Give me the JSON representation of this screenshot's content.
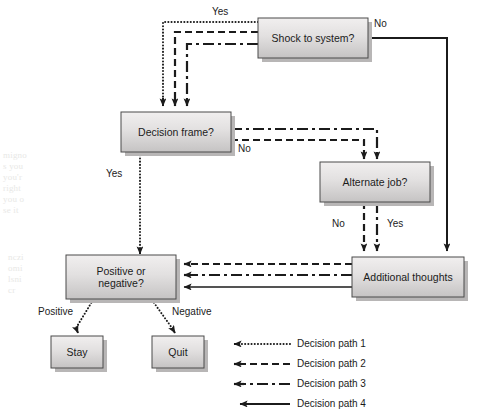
{
  "diagram": {
    "type": "flowchart",
    "nodes": [
      {
        "id": "shock",
        "label": "Shock to system?",
        "x": 258,
        "y": 18,
        "w": 110,
        "h": 40
      },
      {
        "id": "frame",
        "label": "Decision frame?",
        "x": 121,
        "y": 112,
        "w": 110,
        "h": 40
      },
      {
        "id": "alternate",
        "label": "Alternate job?",
        "x": 320,
        "y": 162,
        "w": 110,
        "h": 40
      },
      {
        "id": "additional",
        "label": "Additional thoughts",
        "x": 352,
        "y": 257,
        "w": 112,
        "h": 40
      },
      {
        "id": "posneg",
        "label": "Positive or\nnegative?",
        "x": 66,
        "y": 255,
        "w": 110,
        "h": 44
      },
      {
        "id": "stay",
        "label": "Stay",
        "x": 51,
        "y": 336,
        "w": 52,
        "h": 32
      },
      {
        "id": "quit",
        "label": "Quit",
        "x": 152,
        "y": 336,
        "w": 52,
        "h": 32
      }
    ],
    "edge_labels": [
      {
        "id": "shock-yes",
        "text": "Yes",
        "x": 212,
        "y": 6
      },
      {
        "id": "shock-no",
        "text": "No",
        "x": 374,
        "y": 18
      },
      {
        "id": "frame-no",
        "text": "No",
        "x": 238,
        "y": 143
      },
      {
        "id": "frame-yes",
        "text": "Yes",
        "x": 106,
        "y": 168
      },
      {
        "id": "alternate-no",
        "text": "No",
        "x": 332,
        "y": 218
      },
      {
        "id": "alternate-yes",
        "text": "Yes",
        "x": 387,
        "y": 218
      },
      {
        "id": "posneg-positive",
        "text": "Positive",
        "x": 38,
        "y": 306
      },
      {
        "id": "posneg-negative",
        "text": "Negative",
        "x": 172,
        "y": 306
      }
    ],
    "legend": {
      "items": [
        {
          "id": "path1",
          "label": "Decision path 1",
          "style": "dotted"
        },
        {
          "id": "path2",
          "label": "Decision path 2",
          "style": "dashed"
        },
        {
          "id": "path3",
          "label": "Decision path 3",
          "style": "dashdot"
        },
        {
          "id": "path4",
          "label": "Decision path 4",
          "style": "solid"
        }
      ],
      "x": 232,
      "y": 339,
      "row_gap": 20,
      "line_len": 58,
      "label_x": 297
    },
    "colors": {
      "line": "#1b1b1b",
      "node_fill_top": "#eceaea",
      "node_fill_bottom": "#c9c7c7",
      "node_border": "#4a4a4a",
      "node_shadow": "#b8b6b6",
      "text": "#1b1b1b",
      "background": "#ffffff",
      "ghost_text": "#e8e8e6"
    },
    "paths": [
      {
        "id": "path1",
        "name": "decision-path-1",
        "style": "dotted",
        "route": "shock Yes -> frame -> posneg -> Stay/Quit"
      },
      {
        "id": "path2",
        "name": "decision-path-2",
        "style": "dashed",
        "route": "shock Yes -> frame -> No -> alternate -> No -> additional -> posneg"
      },
      {
        "id": "path3",
        "name": "decision-path-3",
        "style": "dashdot",
        "route": "shock Yes -> frame -> No -> alternate -> Yes -> additional -> posneg"
      },
      {
        "id": "path4",
        "name": "decision-path-4",
        "style": "solid",
        "route": "shock No -> additional -> posneg"
      }
    ]
  },
  "ghost_text": {
    "block_a": "migno\ns you\nyou'r\nright\nyou o\nse it",
    "block_b": "nczi\nomi\nlsni\ncr"
  }
}
